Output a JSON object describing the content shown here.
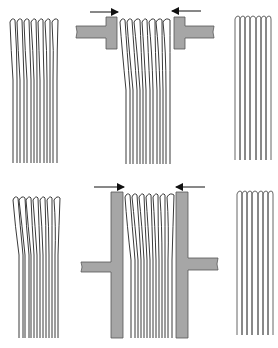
{
  "diagram": {
    "colors": {
      "background": "#ffffff",
      "fiber_stroke": "#3a3a3a",
      "clamp_fill": "#a6a6a6",
      "clamp_stroke": "#555555",
      "arrow": "#111111"
    },
    "rows": [
      {
        "id": "top",
        "clamp_type": "short-T-jaw",
        "panels": [
          "splayed-fibers",
          "clamped-fibers",
          "aligned-fibers"
        ],
        "fiber_count": 7,
        "arrows": [
          "right-pointing",
          "left-pointing"
        ]
      },
      {
        "id": "bottom",
        "clamp_type": "long-plate-jaw",
        "panels": [
          "splayed-fibers",
          "clamped-fibers",
          "aligned-fibers"
        ],
        "fiber_count": 7,
        "arrows": [
          "right-pointing",
          "left-pointing"
        ]
      }
    ]
  }
}
